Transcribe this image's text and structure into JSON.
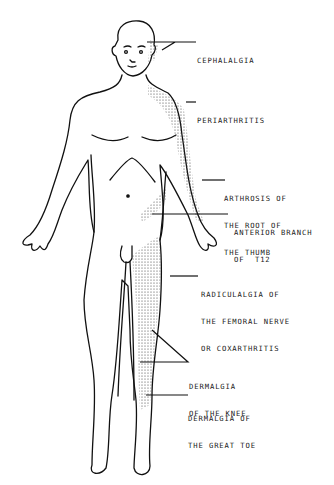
{
  "figure": {
    "labels": [
      {
        "id": "cephalalgia",
        "lines": [
          "CEPHALALGIA"
        ]
      },
      {
        "id": "periarthritis",
        "lines": [
          "PERIARTHRITIS"
        ]
      },
      {
        "id": "arthrosis",
        "lines": [
          "ARTHROSIS OF",
          "THE ROOT OF",
          "THE THUMB"
        ]
      },
      {
        "id": "anterior_branch",
        "lines": [
          "ANTERIOR BRANCH",
          "OF  T12"
        ]
      },
      {
        "id": "radiculalgia",
        "lines": [
          "RADICULALGIA OF",
          "THE FEMORAL NERVE",
          "OR COXARTHRITIS"
        ]
      },
      {
        "id": "dermalgia_knee",
        "lines": [
          "DERMALGIA",
          "OF THE KNEE"
        ]
      },
      {
        "id": "dermalgia_toe",
        "lines": [
          "DERMALGIA OF",
          "THE GREAT TOE"
        ]
      }
    ]
  }
}
